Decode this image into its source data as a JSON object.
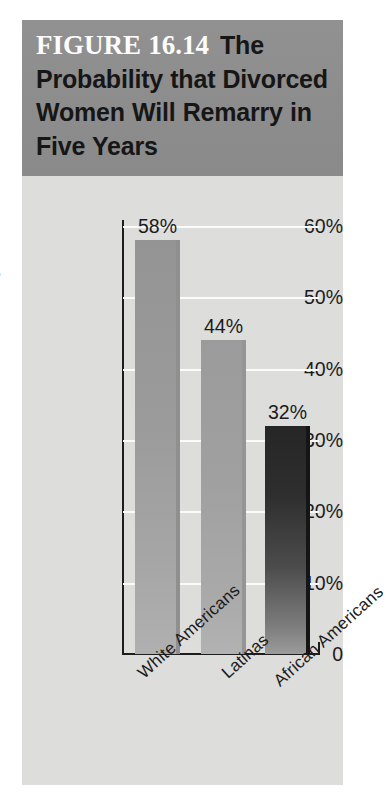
{
  "figure": {
    "number_label": "FIGURE 16.14",
    "title": "The Probability that Divorced Women Will Remarry in Five Years"
  },
  "colors": {
    "banner_background": "#8d8d8d",
    "panel_background": "#dddddb",
    "gridline": "#fbfbfb",
    "axis": "#1d1d1d",
    "text": "#1b1b1b",
    "figure_number_text": "#fdfdfd",
    "bar_1": "#9a9a9a",
    "bar_2": "#9d9d9d",
    "bar_3": "#2a2a2a"
  },
  "chart_data": {
    "type": "bar",
    "title": "The Probability that Divorced Women Will Remarry in Five Years",
    "xlabel": "",
    "ylabel": "Percentage",
    "categories": [
      "White Americans",
      "Latinas",
      "African Americans"
    ],
    "values": [
      58,
      44,
      32
    ],
    "value_labels": [
      "58%",
      "44%",
      "32%"
    ],
    "ylim": [
      0,
      60
    ],
    "ytick_values": [
      0,
      10,
      20,
      30,
      40,
      50,
      60
    ],
    "ytick_labels": [
      "0",
      "10%",
      "20%",
      "30%",
      "40%",
      "50%",
      "60%"
    ],
    "grid": "horizontal",
    "gridline_values": [
      10,
      20,
      30,
      40,
      50,
      60
    ],
    "legend": null,
    "bar_colors": [
      "#9a9a9a",
      "#9d9d9d",
      "#2a2a2a"
    ]
  }
}
